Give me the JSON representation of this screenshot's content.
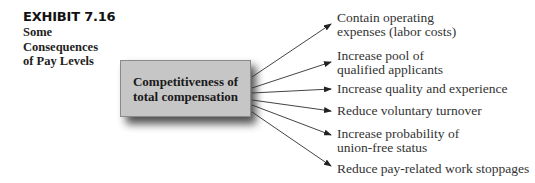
{
  "exhibit": {
    "number": "EXHIBIT 7.16",
    "title_lines": [
      "Some",
      "Consequences",
      "of Pay Levels"
    ]
  },
  "center_box": {
    "lines": [
      "Competitiveness of",
      "total compensation"
    ],
    "fill_color": "#c6c6c6"
  },
  "consequences": [
    {
      "lines": [
        "Contain operating",
        "expenses (labor costs)"
      ]
    },
    {
      "lines": [
        "Increase pool of",
        "qualified applicants"
      ]
    },
    {
      "lines": [
        "Increase quality and experience"
      ]
    },
    {
      "lines": [
        "Reduce voluntary turnover"
      ]
    },
    {
      "lines": [
        "Increase probability of",
        "union-free status"
      ]
    },
    {
      "lines": [
        "Reduce pay-related work stoppages"
      ]
    }
  ]
}
